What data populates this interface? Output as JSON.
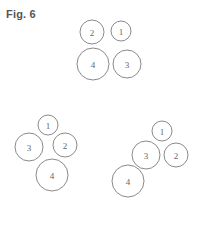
{
  "figure": {
    "label": "Fig. 6",
    "stroke_color": "#8a8a8a",
    "text_color": "#666666",
    "groups": [
      {
        "name": "square-arrangement",
        "circles": [
          {
            "label": "2",
            "cx": 92,
            "cy": 32,
            "r": 12
          },
          {
            "label": "1",
            "cx": 121,
            "cy": 31,
            "r": 10
          },
          {
            "label": "4",
            "cx": 93,
            "cy": 64,
            "r": 16
          },
          {
            "label": "3",
            "cx": 127,
            "cy": 64,
            "r": 14
          }
        ]
      },
      {
        "name": "diamond-arrangement",
        "circles": [
          {
            "label": "1",
            "cx": 48,
            "cy": 125,
            "r": 10
          },
          {
            "label": "3",
            "cx": 29,
            "cy": 147,
            "r": 14
          },
          {
            "label": "2",
            "cx": 65,
            "cy": 145,
            "r": 12
          },
          {
            "label": "4",
            "cx": 52,
            "cy": 175,
            "r": 16
          }
        ]
      },
      {
        "name": "diagonal-arrangement",
        "circles": [
          {
            "label": "1",
            "cx": 162,
            "cy": 131,
            "r": 10
          },
          {
            "label": "3",
            "cx": 146,
            "cy": 155,
            "r": 14
          },
          {
            "label": "2",
            "cx": 176,
            "cy": 155,
            "r": 12
          },
          {
            "label": "4",
            "cx": 128,
            "cy": 181,
            "r": 16
          }
        ]
      }
    ]
  }
}
